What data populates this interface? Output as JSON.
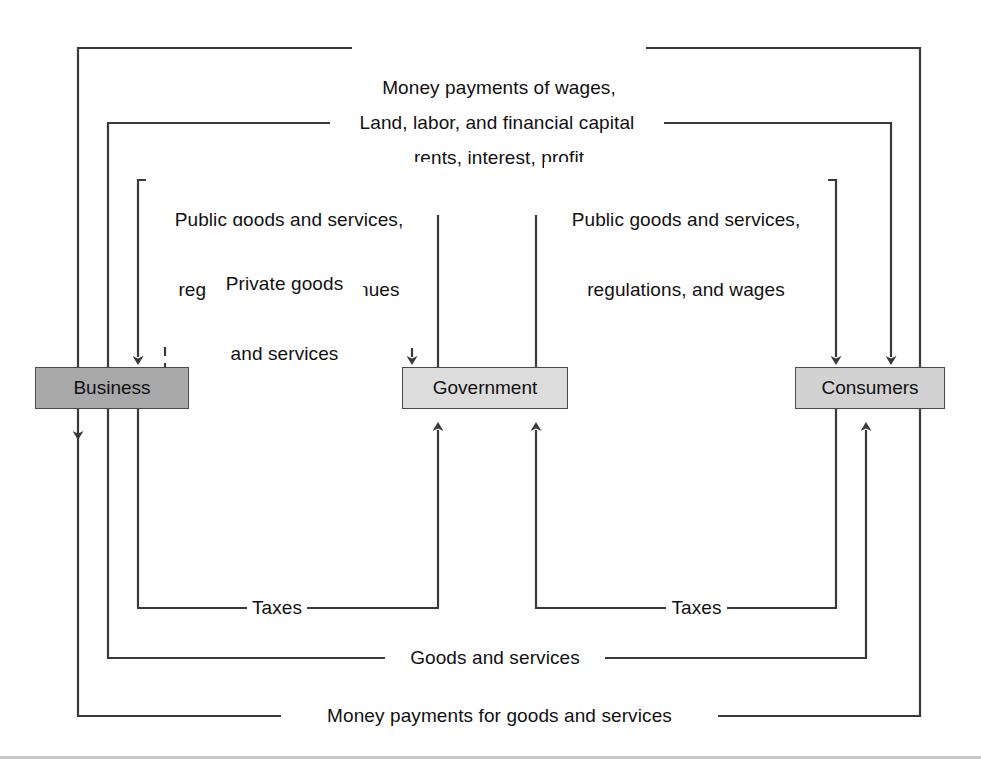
{
  "diagram": {
    "type": "circular-flow",
    "background": "#ffffff",
    "line_color": "#3a3a3a",
    "entities": [
      {
        "id": "business",
        "label": "Business",
        "fill": "#a8a8a8",
        "x": 35,
        "y": 367,
        "w": 154,
        "h": 42
      },
      {
        "id": "government",
        "label": "Government",
        "fill": "#dcdcdc",
        "x": 402,
        "y": 367,
        "w": 166,
        "h": 42
      },
      {
        "id": "consumers",
        "label": "Consumers",
        "fill": "#d2d2d2",
        "x": 795,
        "y": 367,
        "w": 150,
        "h": 42
      }
    ],
    "flows": [
      {
        "id": "money-wages",
        "from": "consumers",
        "to": "business",
        "label": "Money payments of wages,\nrents, interest, profit",
        "style": "solid"
      },
      {
        "id": "land-labor-capital",
        "from": "business",
        "to": "consumers",
        "label": "Land, labor, and financial capital",
        "style": "solid"
      },
      {
        "id": "public-business",
        "from": "government",
        "to": "business",
        "label": "Public goods and services,\nregulations, and revenues",
        "style": "solid"
      },
      {
        "id": "private-goods",
        "from": "business",
        "to": "government",
        "label": "Private goods\nand services",
        "style": "dashed"
      },
      {
        "id": "public-consumers",
        "from": "government",
        "to": "consumers",
        "label": "Public goods and services,\nregulations, and wages",
        "style": "solid"
      },
      {
        "id": "taxes-business",
        "from": "business",
        "to": "government",
        "label": "Taxes",
        "style": "solid"
      },
      {
        "id": "taxes-consumers",
        "from": "consumers",
        "to": "government",
        "label": "Taxes",
        "style": "solid"
      },
      {
        "id": "goods-services",
        "from": "business",
        "to": "consumers",
        "label": "Goods and services",
        "style": "solid"
      },
      {
        "id": "money-goods",
        "from": "consumers",
        "to": "business",
        "label": "Money payments for goods and services",
        "style": "solid"
      }
    ],
    "labels": {
      "money_wages_line1": "Money payments of wages,",
      "money_wages_line2": "rents, interest, profit",
      "land_labor": "Land, labor, and financial capital",
      "public_business_line1": "Public goods and services,",
      "public_business_line2": "regulations, and revenues",
      "private_line1": "Private goods",
      "private_line2": "and services",
      "public_consumers_line1": "Public goods and services,",
      "public_consumers_line2": "regulations, and wages",
      "taxes_left": "Taxes",
      "taxes_right": "Taxes",
      "goods_services": "Goods and services",
      "money_goods": "Money payments for goods and services"
    }
  }
}
